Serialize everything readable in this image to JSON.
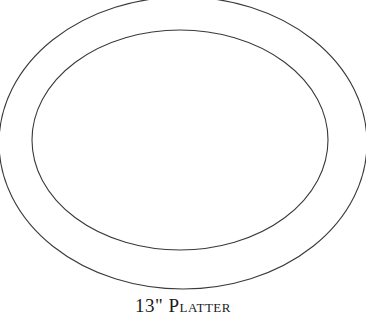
{
  "diagram": {
    "title": "13\" Platter",
    "stroke_color": "#3a3a3a",
    "background": "#ffffff",
    "shapes": [
      {
        "name": "outer-rim",
        "type": "ellipse",
        "cx": 183,
        "cy": 143,
        "rx": 184,
        "ry": 146
      },
      {
        "name": "inner-well",
        "type": "ellipse",
        "cx": 180,
        "cy": 140,
        "rx": 148,
        "ry": 110
      }
    ]
  }
}
